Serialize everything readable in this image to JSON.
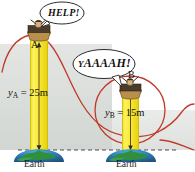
{
  "figure": {
    "background_color": "#ffffff",
    "haze_color": "#d9dcd8",
    "tower_color": "#f7e72e",
    "tower_edge_color": "#d6c100",
    "curve_color": "#c0392b",
    "earth_land_color": "#2f8f3e",
    "earth_water_color": "#2f6fa8"
  },
  "speech_bubbles": [
    {
      "name": "bubble-help",
      "text": "HELP!",
      "speaker": "A"
    },
    {
      "name": "bubble-yaaaah",
      "lead": "Y",
      "rest": "AAAAH!",
      "text": "YAAAAH!",
      "speaker": "B"
    }
  ],
  "towers": [
    {
      "id": "A",
      "point_label": "A",
      "height_label": {
        "var": "y",
        "sub": "A",
        "equals": " = ",
        "value": "25m",
        "full": "yA = 25m"
      },
      "ground_label": "Earth"
    },
    {
      "id": "B",
      "point_label": "B",
      "height_label": {
        "var": "y",
        "sub": "B",
        "equals": " = ",
        "value": "15m",
        "full": "yB = 15m"
      },
      "ground_label": "Earth"
    }
  ],
  "annotations": {
    "baseline": "dashed-reference-line"
  }
}
